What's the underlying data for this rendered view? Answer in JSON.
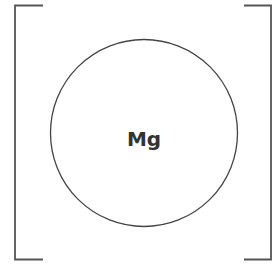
{
  "diagram": {
    "type": "lewis-structure-ion",
    "element_symbol": "Mg",
    "bracket_color": "#555555",
    "circle_color": "#444444"
  }
}
